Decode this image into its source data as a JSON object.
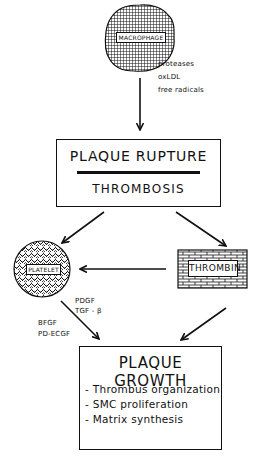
{
  "diagram": {
    "nodes": {
      "macrophage": {
        "label": "MACROPHAGE",
        "shape": "textured-blob"
      },
      "plaque_rupture": {
        "title": "PLAQUE RUPTURE",
        "subtitle": "THROMBOSIS"
      },
      "platelet": {
        "label": "PLATELET",
        "shape": "textured-circle"
      },
      "thrombin": {
        "label": "THROMBIN",
        "shape": "brick-box"
      },
      "plaque_growth": {
        "title": "PLAQUE GROWTH",
        "items": [
          "- Thrombus organization",
          "- SMC proliferation",
          "- Matrix synthesis"
        ]
      }
    },
    "edge_labels": {
      "macrophage_to_rupture": [
        "proteases",
        "oxLDL",
        "free radicals"
      ],
      "platelet_to_growth_right": [
        "PDGF",
        "TGF - β"
      ],
      "platelet_to_growth_left": [
        "BFGF",
        "PD-ECGF"
      ]
    },
    "edges": [
      {
        "from": "macrophage",
        "to": "plaque_rupture"
      },
      {
        "from": "plaque_rupture",
        "to": "platelet"
      },
      {
        "from": "plaque_rupture",
        "to": "thrombin"
      },
      {
        "from": "thrombin",
        "to": "platelet"
      },
      {
        "from": "platelet",
        "to": "plaque_growth"
      },
      {
        "from": "thrombin",
        "to": "plaque_growth"
      }
    ]
  }
}
